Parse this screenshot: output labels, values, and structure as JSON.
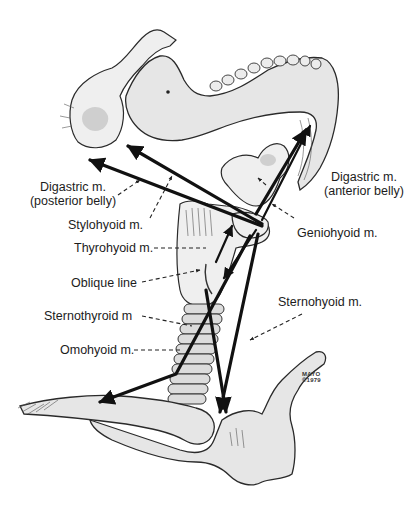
{
  "figure": {
    "labels": {
      "digastric_posterior_line1": "Digastric m.",
      "digastric_posterior_line2": "(posterior belly)",
      "stylohyoid": "Stylohyoid m.",
      "thyrohyoid": "Thyrohyoid m.",
      "oblique_line": "Oblique line",
      "sternothyroid": "Sternothyroid m",
      "omohyoid": "Omohyoid m.",
      "digastric_anterior_line1": "Digastric m.",
      "digastric_anterior_line2": "(anterior belly)",
      "geniohyoid": "Geniohyoid m.",
      "sternohyoid": "Sternohyoid m."
    },
    "credit": {
      "line1": "MAYO",
      "line2": "©1979"
    }
  }
}
